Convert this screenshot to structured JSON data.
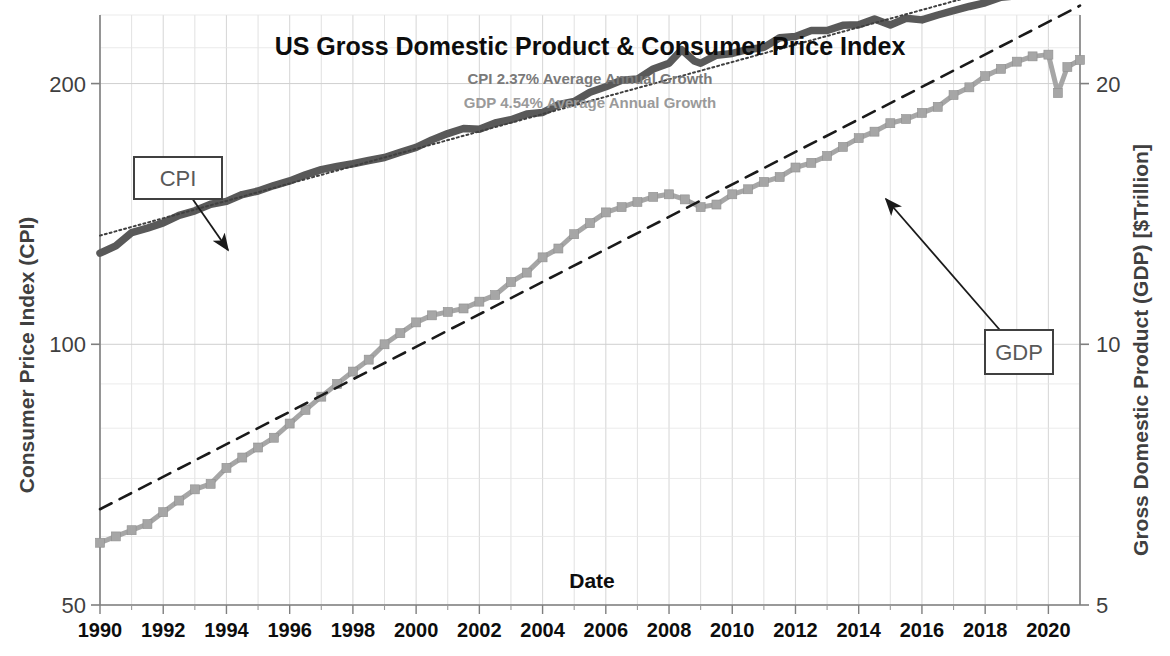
{
  "chart_data": {
    "type": "line",
    "title": "US Gross Domestic Product & Consumer Price Index",
    "annotations": [
      "CPI 2.37% Average Annual Growth",
      "GDP 4.54% Average Annual Growth"
    ],
    "xlabel": "Date",
    "ylabel": "Consumer Price Index (CPI)",
    "y2label": "Gross Domestic Product (GDP) [$Trillion]",
    "xlim": [
      1990,
      2021
    ],
    "ylim": [
      50,
      240
    ],
    "y2lim": [
      5,
      24
    ],
    "yscale": "log",
    "y2scale": "log",
    "grid": true,
    "legend": "none",
    "xticks": [
      "1990",
      "1992",
      "1994",
      "1996",
      "1998",
      "2000",
      "2002",
      "2004",
      "2006",
      "2008",
      "2010",
      "2012",
      "2014",
      "2016",
      "2018",
      "2020"
    ],
    "yticks": [
      "200",
      "100",
      "50"
    ],
    "y2ticks": [
      "20",
      "10",
      "5"
    ],
    "callouts": [
      {
        "label": "CPI",
        "box_x": 134,
        "box_y": 157,
        "box_w": 88,
        "box_h": 42,
        "tip_x": 228,
        "tip_y": 250
      },
      {
        "label": "GDP",
        "box_x": 985,
        "box_y": 330,
        "box_w": 68,
        "box_h": 44,
        "tip_x": 886,
        "tip_y": 199
      }
    ],
    "series": [
      {
        "name": "CPI",
        "axis": "left",
        "color": "#595959",
        "style": "line-markers",
        "x": [
          1990.0,
          1990.5,
          1991.0,
          1991.5,
          1992.0,
          1992.5,
          1993.0,
          1993.5,
          1994.0,
          1994.5,
          1995.0,
          1995.5,
          1996.0,
          1996.5,
          1997.0,
          1997.5,
          1998.0,
          1998.5,
          1999.0,
          1999.5,
          2000.0,
          2000.5,
          2001.0,
          2001.5,
          2002.0,
          2002.5,
          2003.0,
          2003.5,
          2004.0,
          2004.5,
          2005.0,
          2005.5,
          2006.0,
          2006.5,
          2007.0,
          2007.5,
          2008.0,
          2008.4,
          2008.8,
          2009.0,
          2009.5,
          2010.0,
          2010.5,
          2011.0,
          2011.5,
          2012.0,
          2012.5,
          2013.0,
          2013.5,
          2014.0,
          2014.5,
          2015.0,
          2015.5,
          2016.0,
          2016.5,
          2017.0,
          2017.5,
          2018.0,
          2018.5,
          2019.0,
          2019.5,
          2020.0,
          2020.5,
          2021.0
        ],
        "y": [
          127.4,
          129.9,
          134.6,
          136.2,
          138.1,
          140.9,
          142.6,
          145.1,
          146.2,
          148.9,
          150.3,
          152.5,
          154.4,
          156.9,
          159.1,
          160.5,
          161.6,
          163.0,
          164.3,
          166.6,
          168.8,
          172.2,
          175.1,
          177.5,
          177.1,
          180.1,
          181.7,
          184.5,
          185.2,
          189.1,
          190.7,
          195.4,
          198.3,
          201.8,
          202.4,
          207.9,
          211.1,
          218.8,
          212.4,
          211.1,
          215.7,
          216.7,
          219.0,
          220.2,
          225.9,
          226.7,
          230.3,
          230.3,
          233.5,
          233.9,
          237.4,
          233.7,
          237.9,
          236.9,
          240.0,
          242.8,
          245.5,
          247.9,
          251.6,
          252.6,
          256.1,
          257.9,
          259.1,
          261.6
        ]
      },
      {
        "name": "CPI trend",
        "axis": "left",
        "color": "#404040",
        "style": "dotted",
        "growth_pct": 2.37,
        "x": [
          1990,
          2021
        ],
        "y": [
          133.5,
          273.0
        ]
      },
      {
        "name": "GDP",
        "axis": "right",
        "color": "#a6a6a6",
        "style": "line-markers",
        "x": [
          1990.0,
          1990.5,
          1991.0,
          1991.5,
          1992.0,
          1992.5,
          1993.0,
          1993.5,
          1994.0,
          1994.5,
          1995.0,
          1995.5,
          1996.0,
          1996.5,
          1997.0,
          1997.5,
          1998.0,
          1998.5,
          1999.0,
          1999.5,
          2000.0,
          2000.5,
          2001.0,
          2001.5,
          2002.0,
          2002.5,
          2003.0,
          2003.5,
          2004.0,
          2004.5,
          2005.0,
          2005.5,
          2006.0,
          2006.5,
          2007.0,
          2007.5,
          2008.0,
          2008.5,
          2009.0,
          2009.5,
          2010.0,
          2010.5,
          2011.0,
          2011.5,
          2012.0,
          2012.5,
          2013.0,
          2013.5,
          2014.0,
          2014.5,
          2015.0,
          2015.5,
          2016.0,
          2016.5,
          2017.0,
          2017.5,
          2018.0,
          2018.5,
          2019.0,
          2019.5,
          2020.0,
          2020.3,
          2020.6,
          2021.0
        ],
        "y": [
          5.9,
          6.0,
          6.1,
          6.2,
          6.4,
          6.6,
          6.8,
          6.9,
          7.2,
          7.4,
          7.6,
          7.8,
          8.1,
          8.4,
          8.7,
          9.0,
          9.3,
          9.6,
          10.0,
          10.3,
          10.6,
          10.8,
          10.9,
          11.0,
          11.2,
          11.4,
          11.8,
          12.1,
          12.6,
          12.9,
          13.4,
          13.8,
          14.2,
          14.4,
          14.6,
          14.8,
          14.9,
          14.7,
          14.4,
          14.5,
          14.9,
          15.1,
          15.4,
          15.6,
          16.0,
          16.2,
          16.5,
          16.9,
          17.3,
          17.6,
          18.0,
          18.2,
          18.5,
          18.8,
          19.4,
          19.8,
          20.4,
          20.8,
          21.2,
          21.5,
          21.6,
          19.5,
          20.9,
          21.3
        ]
      },
      {
        "name": "GDP trend",
        "axis": "right",
        "color": "#1a1a1a",
        "style": "dashed",
        "growth_pct": 4.54,
        "x": [
          1990,
          2021
        ],
        "y": [
          6.45,
          24.6
        ]
      }
    ]
  }
}
